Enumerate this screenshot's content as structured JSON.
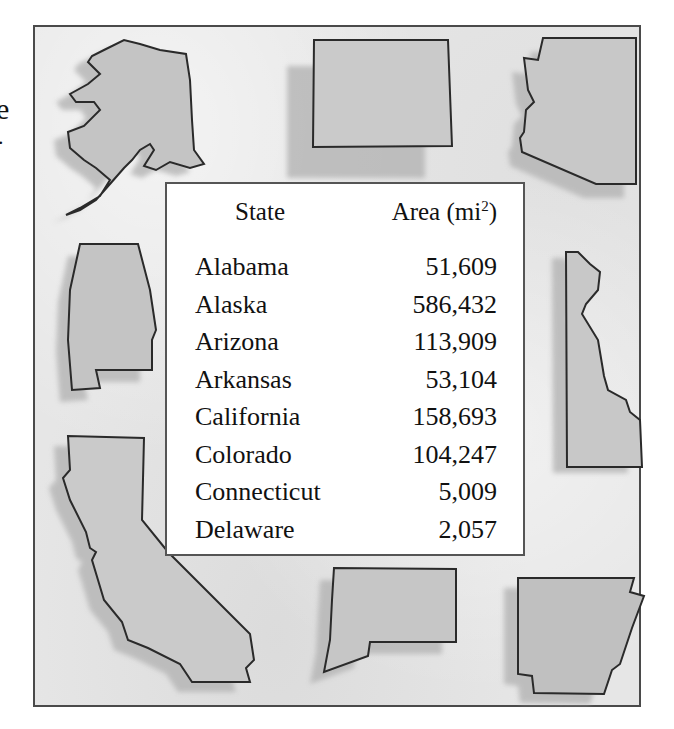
{
  "margin_text": {
    "fragment_1": "e",
    "fragment_2": "."
  },
  "illustration": {
    "style": "watercolor state silhouettes",
    "frame_color": "#4a4a4a",
    "fill_color": "#c8c8c8",
    "shadow_color": "#b4b4b4",
    "outline_color": "#2a2a2a",
    "states_depicted": [
      "Alaska",
      "Colorado",
      "Arizona",
      "Alabama",
      "Delaware",
      "California",
      "Connecticut",
      "Arkansas"
    ]
  },
  "table": {
    "headers": {
      "state": "State",
      "area": "Area (mi",
      "area_sup": "2",
      "area_close": ")"
    },
    "rows": [
      {
        "state": "Alabama",
        "area": "51,609"
      },
      {
        "state": "Alaska",
        "area": "586,432"
      },
      {
        "state": "Arizona",
        "area": "113,909"
      },
      {
        "state": "Arkansas",
        "area": "53,104"
      },
      {
        "state": "California",
        "area": "158,693"
      },
      {
        "state": "Colorado",
        "area": "104,247"
      },
      {
        "state": "Connecticut",
        "area": "5,009"
      },
      {
        "state": "Delaware",
        "area": "2,057"
      }
    ]
  }
}
